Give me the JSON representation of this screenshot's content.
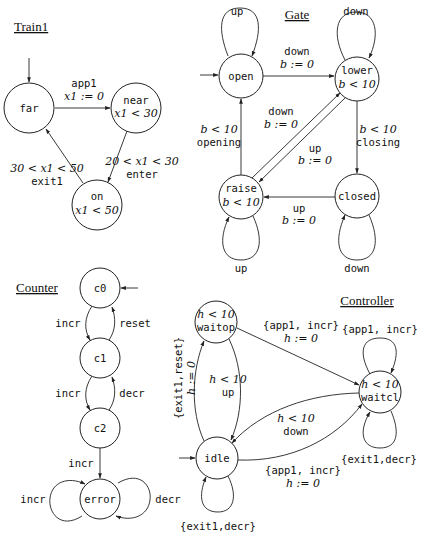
{
  "automata": {
    "train": {
      "title": "Train1",
      "states": [
        {
          "name": "far",
          "invariant": ""
        },
        {
          "name": "near",
          "invariant": "x1 < 30"
        },
        {
          "name": "on",
          "invariant": "x1 < 50"
        }
      ],
      "transitions": [
        {
          "from": "far",
          "to": "near",
          "guard": "",
          "label": "app1",
          "reset": "x1 := 0"
        },
        {
          "from": "near",
          "to": "on",
          "guard": "20 < x1 < 30",
          "label": "enter",
          "reset": ""
        },
        {
          "from": "on",
          "to": "far",
          "guard": "30 < x1 < 50",
          "label": "exit1",
          "reset": ""
        }
      ]
    },
    "gate": {
      "title": "Gate",
      "states": [
        {
          "name": "open",
          "invariant": ""
        },
        {
          "name": "lower",
          "invariant": "b < 10"
        },
        {
          "name": "raise",
          "invariant": "b < 10"
        },
        {
          "name": "closed",
          "invariant": ""
        }
      ],
      "transitions": [
        {
          "from": "open",
          "to": "open",
          "label": "up"
        },
        {
          "from": "open",
          "to": "lower",
          "label": "down",
          "reset": "b := 0"
        },
        {
          "from": "lower",
          "to": "lower",
          "label": "down"
        },
        {
          "from": "lower",
          "to": "closed",
          "guard": "b < 10",
          "label": "closing"
        },
        {
          "from": "closed",
          "to": "closed",
          "label": "down"
        },
        {
          "from": "closed",
          "to": "raise",
          "label": "up",
          "reset": "b := 0"
        },
        {
          "from": "raise",
          "to": "raise",
          "label": "up"
        },
        {
          "from": "raise",
          "to": "open",
          "guard": "b < 10",
          "label": "opening"
        },
        {
          "from": "raise",
          "to": "lower",
          "label": "down",
          "reset": "b := 0"
        },
        {
          "from": "lower",
          "to": "raise",
          "label": "up",
          "reset": "b := 0"
        }
      ]
    },
    "counter": {
      "title": "Counter",
      "states": [
        {
          "name": "c0"
        },
        {
          "name": "c1"
        },
        {
          "name": "c2"
        },
        {
          "name": "error"
        }
      ],
      "transitions": [
        {
          "from": "c0",
          "to": "c1",
          "label": "incr"
        },
        {
          "from": "c1",
          "to": "c0",
          "label": "reset"
        },
        {
          "from": "c1",
          "to": "c2",
          "label": "incr"
        },
        {
          "from": "c2",
          "to": "c1",
          "label": "decr"
        },
        {
          "from": "c2",
          "to": "error",
          "label": "incr"
        },
        {
          "from": "error",
          "to": "error",
          "label": "incr"
        },
        {
          "from": "error",
          "to": "error",
          "label": "decr"
        }
      ]
    },
    "controller": {
      "title": "Controller",
      "states": [
        {
          "name": "waitop",
          "invariant": "h < 10"
        },
        {
          "name": "idle",
          "invariant": ""
        },
        {
          "name": "waitcl",
          "invariant": "h < 10"
        }
      ],
      "transitions": [
        {
          "from": "idle",
          "to": "waitop",
          "label": "{exit1,reset}",
          "reset": "h := 0"
        },
        {
          "from": "waitop",
          "to": "idle",
          "guard": "h < 10",
          "label": "up"
        },
        {
          "from": "waitop",
          "to": "waitcl",
          "label": "{app1, incr}",
          "reset": "h := 0"
        },
        {
          "from": "waitcl",
          "to": "waitcl",
          "label": "{app1, incr}"
        },
        {
          "from": "waitcl",
          "to": "waitcl",
          "label": "{exit1,decr}"
        },
        {
          "from": "waitcl",
          "to": "idle",
          "guard": "h < 10",
          "label": "down"
        },
        {
          "from": "idle",
          "to": "waitcl",
          "label": "{app1, incr}",
          "reset": "h := 0"
        },
        {
          "from": "idle",
          "to": "idle",
          "label": "{exit1,decr}"
        }
      ]
    }
  }
}
